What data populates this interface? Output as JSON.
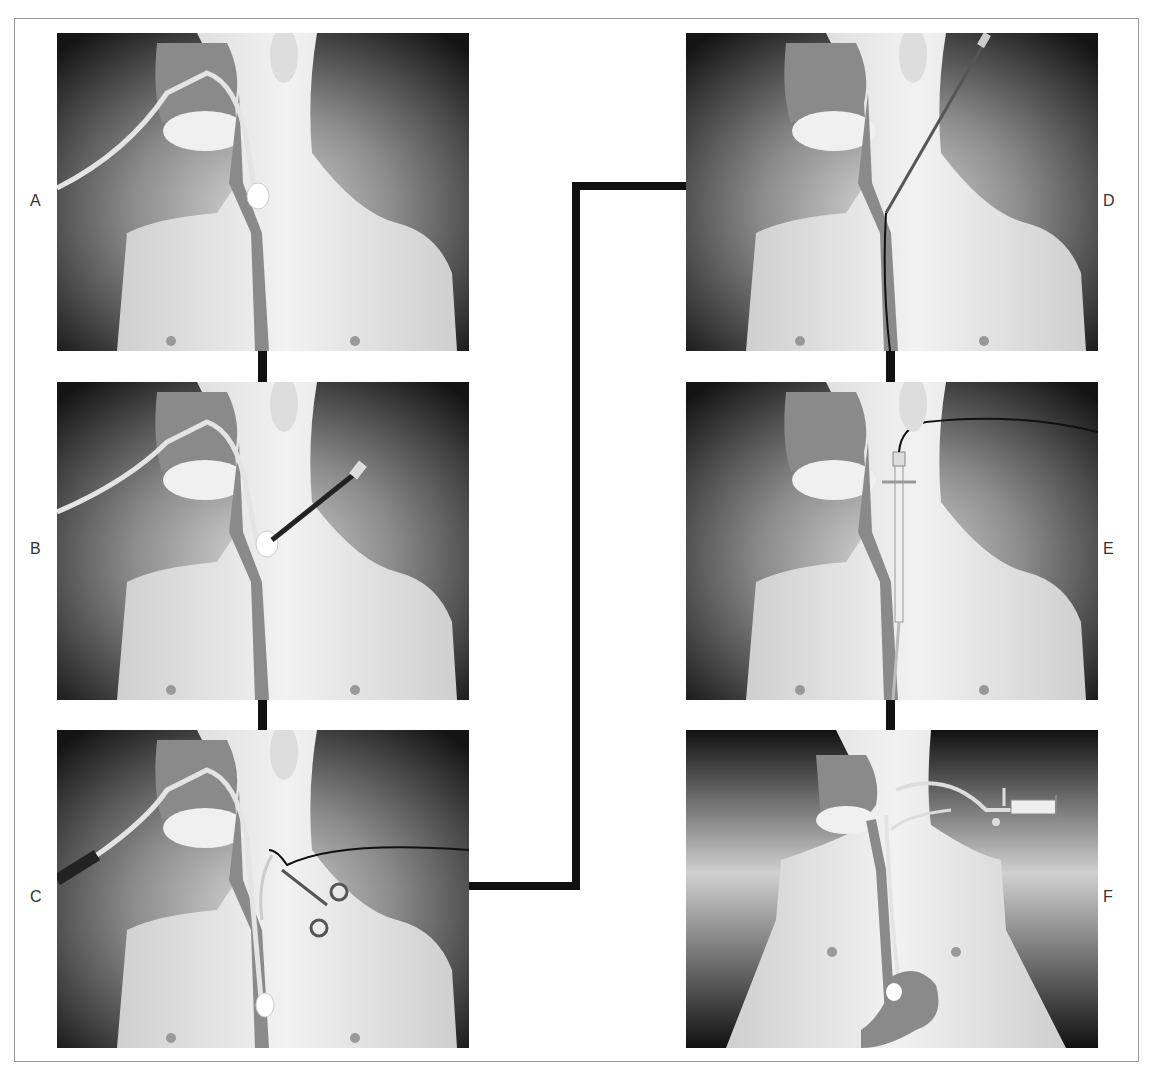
{
  "figure": {
    "panels": [
      {
        "id": "A",
        "label": "A",
        "description": "Nasogastric tube with inflated cuff in esophagus",
        "cuff": true,
        "needle": false,
        "guidewire": false,
        "forceps": false,
        "sheath": false,
        "stomach": false,
        "syringe": false
      },
      {
        "id": "B",
        "label": "B",
        "description": "Needle puncture through neck into esophageal balloon",
        "cuff": true,
        "needle": true,
        "guidewire": false,
        "forceps": false,
        "sheath": false,
        "stomach": false,
        "syringe": false
      },
      {
        "id": "C",
        "label": "C",
        "description": "Guidewire advanced and grasped with forceps",
        "cuff": true,
        "needle": false,
        "guidewire": true,
        "forceps": true,
        "sheath": false,
        "stomach": false,
        "syringe": false
      },
      {
        "id": "D",
        "label": "D",
        "description": "Dilator advanced over guidewire",
        "cuff": false,
        "needle": true,
        "guidewire": true,
        "forceps": false,
        "sheath": false,
        "stomach": false,
        "syringe": false
      },
      {
        "id": "E",
        "label": "E",
        "description": "Peel-away sheath placed",
        "cuff": false,
        "needle": false,
        "guidewire": true,
        "forceps": false,
        "sheath": true,
        "stomach": false,
        "syringe": false
      },
      {
        "id": "F",
        "label": "F",
        "description": "Tube positioned in stomach with balloon inflated by syringe",
        "cuff": false,
        "needle": false,
        "guidewire": false,
        "forceps": false,
        "sheath": false,
        "stomach": true,
        "syringe": true
      }
    ],
    "colors": {
      "background_dark": "#1a1a1a",
      "skin": "#ececec",
      "organ": "#8a8a8a",
      "connector": "#111111",
      "frame": "#9a9a9a"
    }
  }
}
